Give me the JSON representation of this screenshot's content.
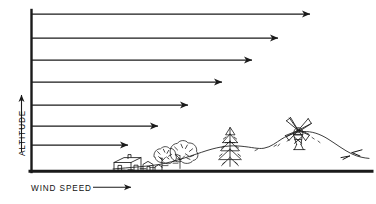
{
  "figure": {
    "style": "hand-drawn line diagram",
    "ink_color": "#1a1a1a",
    "background_color": "#ffffff"
  },
  "axes": {
    "y_label": "ALTITUDE",
    "y_arrow_direction": "up",
    "x_label": "WIND SPEED",
    "x_arrow_direction": "right",
    "y_axis_icon": "up-arrow-icon",
    "x_axis_icon": "right-arrow-icon"
  },
  "scene": {
    "ground_line_label": "ground-baseline",
    "elements": [
      {
        "name": "houses",
        "icon": "house-icon",
        "count": 3
      },
      {
        "name": "deciduous-trees",
        "icon": "tree-icon",
        "count": 2
      },
      {
        "name": "conifer-tree",
        "icon": "pine-tree-icon",
        "count": 1
      },
      {
        "name": "hill",
        "icon": "hill-icon",
        "count": 1
      },
      {
        "name": "windmill",
        "icon": "windmill-icon",
        "count": 1,
        "blades": 4
      }
    ]
  },
  "chart_data": {
    "type": "bar",
    "xlabel": "WIND SPEED",
    "ylabel": "ALTITUDE",
    "orientation": "horizontal",
    "grid": false,
    "legend": false,
    "note": "Horizontal arrows whose length represents wind speed at each altitude; speed increases with height (wind shear over rough terrain).",
    "categories": [
      "level-7 (highest)",
      "level-6",
      "level-5",
      "level-4",
      "level-3",
      "level-2",
      "level-1 (lowest)"
    ],
    "values": [
      100,
      88,
      78,
      68,
      58,
      46,
      36
    ],
    "xlim": [
      0,
      100
    ],
    "ylim": [
      0,
      7
    ],
    "arrows": [
      {
        "index": 1,
        "y": 14,
        "x_start": 31,
        "x_tip": 310,
        "length": 279,
        "relative_speed": 100
      },
      {
        "index": 2,
        "y": 38,
        "x_start": 31,
        "x_tip": 278,
        "length": 247,
        "relative_speed": 88
      },
      {
        "index": 3,
        "y": 60,
        "x_start": 31,
        "x_tip": 252,
        "length": 221,
        "relative_speed": 78
      },
      {
        "index": 4,
        "y": 82,
        "x_start": 31,
        "x_tip": 222,
        "length": 191,
        "relative_speed": 68
      },
      {
        "index": 5,
        "y": 105,
        "x_start": 31,
        "x_tip": 188,
        "length": 157,
        "relative_speed": 58
      },
      {
        "index": 6,
        "y": 126,
        "x_start": 31,
        "x_tip": 158,
        "length": 127,
        "relative_speed": 46
      },
      {
        "index": 7,
        "y": 145,
        "x_start": 31,
        "x_tip": 128,
        "length": 97,
        "relative_speed": 36
      }
    ]
  }
}
